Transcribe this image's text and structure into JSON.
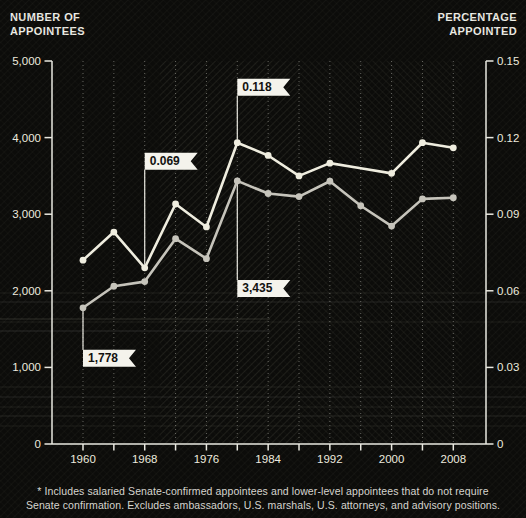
{
  "titles": {
    "left": [
      "NUMBER OF",
      "APPOINTEES"
    ],
    "right": [
      "PERCENTAGE",
      "APPOINTED"
    ]
  },
  "chart_data": {
    "type": "line",
    "x": [
      1960,
      1964,
      1968,
      1972,
      1976,
      1980,
      1984,
      1988,
      1992,
      1996,
      2000,
      2004,
      2008
    ],
    "x_tick_labels": [
      "1960",
      "1968",
      "1976",
      "1984",
      "1992",
      "2000",
      "2008"
    ],
    "series": [
      {
        "name": "appointees",
        "axis": "left",
        "color": "#c6c4bb",
        "values": [
          1778,
          2060,
          2120,
          2680,
          2420,
          3435,
          3270,
          3230,
          3430,
          3110,
          2845,
          3200,
          3215
        ]
      },
      {
        "name": "percentage",
        "axis": "right",
        "color": "#efeddf",
        "values": [
          0.072,
          0.083,
          0.069,
          0.094,
          0.085,
          0.118,
          0.113,
          0.105,
          0.11,
          0.108,
          0.106,
          0.118,
          0.116
        ],
        "no_marker_at": [
          1996
        ]
      }
    ],
    "left_axis": {
      "min": 0,
      "max": 5000,
      "tick_labels": [
        "0",
        "1,000",
        "2,000",
        "3,000",
        "4,000",
        "5,000"
      ]
    },
    "right_axis": {
      "min": 0,
      "max": 0.15,
      "tick_labels": [
        "0",
        "0.03",
        "0.06",
        "0.09",
        "0.12",
        "0.15"
      ]
    },
    "grid": "vertical-dotted-every-4-years",
    "annotations": [
      {
        "label": "1,778",
        "series": "appointees",
        "year": 1960,
        "placement": "below",
        "gap": 42
      },
      {
        "label": "0.069",
        "series": "percentage",
        "year": 1968,
        "placement": "above",
        "gap": 98
      },
      {
        "label": "0.118",
        "series": "percentage",
        "year": 1980,
        "placement": "above",
        "gap": 47
      },
      {
        "label": "3,435",
        "series": "appointees",
        "year": 1980,
        "placement": "below",
        "gap": 99
      }
    ]
  },
  "colors": {
    "background": "#0c0c0a",
    "axis": "#e9e8e0",
    "grid": "#cfcec6",
    "flag_bg": "#f4f3ec",
    "flag_text": "#121210",
    "tick_text": "#eceade"
  },
  "footnote": [
    "* Includes salaried Senate-confirmed appointees and lower-level appointees that do not require",
    "Senate confirmation. Excludes ambassadors, U.S. marshals, U.S. attorneys, and advisory positions."
  ]
}
